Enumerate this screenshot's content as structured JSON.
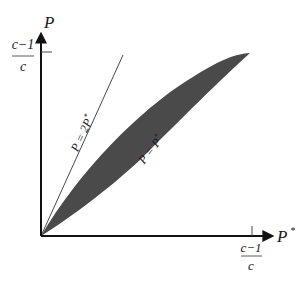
{
  "diagram": {
    "y_axis": {
      "label": "P",
      "tick_label_num": "c−1",
      "tick_label_den": "c"
    },
    "x_axis": {
      "label": "P",
      "label_superscript": "*",
      "tick_label_num": "c−1",
      "tick_label_den": "c"
    },
    "lines": [
      {
        "label": "P = 2P*",
        "label_main": "P = 2P",
        "label_sup": "*"
      },
      {
        "label": "P = P*",
        "label_main": "P = P",
        "label_sup": "*"
      }
    ],
    "colors": {
      "region_fill": "#4a4a4a",
      "axis": "#111111",
      "line": "#333333"
    }
  }
}
